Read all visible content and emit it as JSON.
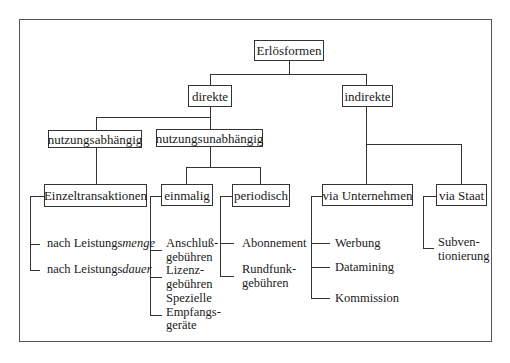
{
  "diagram": {
    "type": "tree",
    "root": {
      "label": "Erlösformen"
    },
    "level1": [
      {
        "id": "direkte",
        "label": "direkte"
      },
      {
        "id": "indirekte",
        "label": "indirekte"
      }
    ],
    "level2": [
      {
        "id": "nutzungsabhaengig",
        "label": "nutzungsabhängig",
        "parent": "direkte"
      },
      {
        "id": "nutzungsunabhaengig",
        "label": "nutzungsunabhängig",
        "parent": "direkte"
      }
    ],
    "level3": [
      {
        "id": "einzeltransaktionen",
        "label": "Einzeltransaktionen",
        "parent": "nutzungsabhaengig"
      },
      {
        "id": "einmalig",
        "label": "einmalig",
        "parent": "nutzungsunabhaengig"
      },
      {
        "id": "periodisch",
        "label": "periodisch",
        "parent": "nutzungsunabhaengig"
      },
      {
        "id": "via_unternehmen",
        "label": "via Unternehmen",
        "parent": "indirekte"
      },
      {
        "id": "via_staat",
        "label": "via Staat",
        "parent": "indirekte"
      }
    ],
    "leaves": {
      "einzeltransaktionen": [
        {
          "prefix": "nach Leistungs",
          "emph": "menge"
        },
        {
          "prefix": "nach Leistungs",
          "emph": "dauer"
        }
      ],
      "einmalig": [
        {
          "line1": "Anschluß-",
          "line2": "gebühren"
        },
        {
          "line1": "Lizenz-",
          "line2": "gebühren"
        },
        {
          "line1": "Spezielle",
          "line2": "Empfangs-",
          "line3": "geräte"
        }
      ],
      "periodisch": [
        {
          "line1": "Abonnement"
        },
        {
          "line1": "Rundfunk-",
          "line2": "gebühren"
        }
      ],
      "via_unternehmen": [
        {
          "line1": "Werbung"
        },
        {
          "line1": "Datamining"
        },
        {
          "line1": "Kommission"
        }
      ],
      "via_staat": [
        {
          "line1": "Subven-",
          "line2": "tionierung"
        }
      ]
    }
  }
}
